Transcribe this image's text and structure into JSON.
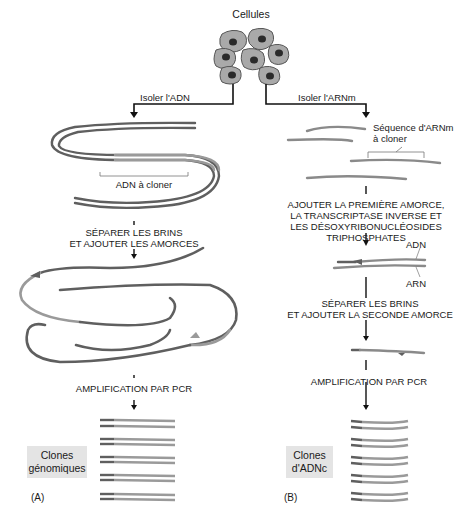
{
  "title": "Cellules",
  "left_branch": {
    "isolate_label": "Isoler l'ADN",
    "dna_to_clone_label": "ADN à cloner",
    "step1_line1": "SÉPARER LES BRINS",
    "step1_line2": "ET AJOUTER LES AMORCES",
    "step2": "AMPLIFICATION PAR PCR",
    "result_line1": "Clones",
    "result_line2": "génomiques",
    "panel": "(A)"
  },
  "right_branch": {
    "isolate_label": "Isoler l'ARNm",
    "mrna_label_line1": "Séquence d'ARNm",
    "mrna_label_line2": "à cloner",
    "step1_line1": "AJOUTER LA PREMIÈRE AMORCE,",
    "step1_line2": "LA TRANSCRIPTASE INVERSE ET",
    "step1_line3": "LES DÉSOXYRIBONUCLÉOSIDES",
    "step1_line4": "TRIPHOSPHATES",
    "dna_label": "ADN",
    "rna_label": "ARN",
    "step2_line1": "SÉPARER LES BRINS",
    "step2_line2": "ET AJOUTER LA SECONDE AMORCE",
    "step3": "AMPLIFICATION PAR PCR",
    "result_line1": "Clones",
    "result_line2": "d'ADNc",
    "panel": "(B)"
  },
  "colors": {
    "strand_dark": "#5f5f5f",
    "strand_light": "#9a9a9a",
    "strand_target": "#8a8a8a",
    "cell_fill": "#a9a9a9",
    "nucleus": "#2a2a2a",
    "box_bg": "#e4e4e4",
    "text": "#1a1a1a"
  }
}
